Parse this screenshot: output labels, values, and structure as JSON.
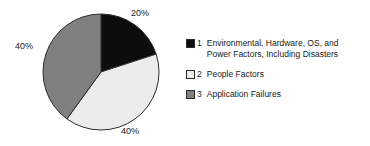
{
  "chart_data": {
    "type": "pie",
    "title": "",
    "subtitle": "",
    "xlabel": "",
    "ylabel": "",
    "legend_position": "right",
    "grid": false,
    "start_angle_deg": 0,
    "direction": "clockwise",
    "categories": [
      "Environmental, Hardware, OS, and Power Factors, Including Disasters",
      "People Factors",
      "Application Failures"
    ],
    "values": [
      20,
      40,
      40
    ],
    "value_unit": "%",
    "data_labels": [
      "20%",
      "40%",
      "40%"
    ],
    "colors": [
      "#0d0d0d",
      "#ececec",
      "#808080"
    ],
    "slice_edge_color": "#2b2b2b"
  },
  "legend": {
    "items": [
      {
        "index": "1",
        "label": "Environmental, Hardware, OS, and\nPower Factors, Including Disasters",
        "color": "#0d0d0d"
      },
      {
        "index": "2",
        "label": "People Factors",
        "color": "#ececec"
      },
      {
        "index": "3",
        "label": "Application Failures",
        "color": "#808080"
      }
    ]
  },
  "pie_geometry": {
    "center_x": 101,
    "center_y": 72,
    "radius": 58
  }
}
